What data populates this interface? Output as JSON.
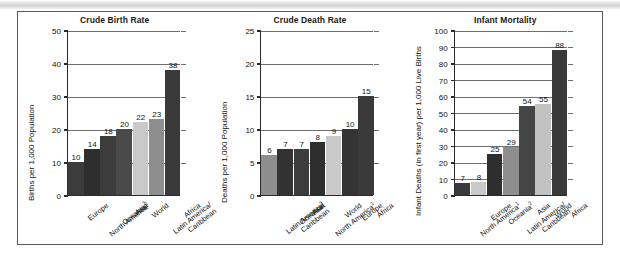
{
  "figure": {
    "panel_count": 3
  },
  "chart_data": [
    {
      "type": "bar",
      "title": "Crude Birth Rate",
      "ylabel": "Births per 1,000 Population",
      "xlabel": "",
      "ylim": [
        0,
        50
      ],
      "yticks": [
        0,
        10,
        20,
        30,
        40,
        50
      ],
      "grid": true,
      "categories": [
        "Europe",
        "North America¹",
        "Oceania²",
        "Asia",
        "World",
        "Latin America/ Caribbean",
        "Africa"
      ],
      "category_lines": [
        [
          "Europe"
        ],
        [
          "North America¹"
        ],
        [
          "Oceania²"
        ],
        [
          "Asia"
        ],
        [
          "World"
        ],
        [
          "Latin America/",
          "Caribbean"
        ],
        [
          "Africa"
        ]
      ],
      "values": [
        10,
        14,
        18,
        20,
        22,
        23,
        38
      ],
      "value_labels": [
        "10",
        "14",
        "18",
        "20",
        "22",
        "23",
        "38"
      ],
      "bar_colors": [
        "#3c3c3c",
        "#2e2e2e",
        "#3c3c3c",
        "#4a4a4a",
        "#c9c9c9",
        "#8e8e8e",
        "#3a3a3a"
      ]
    },
    {
      "type": "bar",
      "title": "Crude Death Rate",
      "ylabel": "Deaths per 1,000 Population",
      "xlabel": "",
      "ylim": [
        0,
        25
      ],
      "yticks": [
        0,
        5,
        10,
        15,
        20,
        25
      ],
      "grid": true,
      "categories": [
        "Latin America/ Caribbean",
        "Oceania²",
        "Asia",
        "North America¹",
        "World",
        "Europe",
        "Africa"
      ],
      "category_lines": [
        [
          "Latin America/",
          "Caribbean"
        ],
        [
          "Oceania²"
        ],
        [
          "Asia"
        ],
        [
          "North America¹"
        ],
        [
          "World"
        ],
        [
          "Europe"
        ],
        [
          "Africa"
        ]
      ],
      "values": [
        6,
        7,
        7,
        8,
        9,
        10,
        15
      ],
      "value_labels": [
        "6",
        "7",
        "7",
        "8",
        "9",
        "10",
        "15"
      ],
      "bar_colors": [
        "#8e8e8e",
        "#323232",
        "#3c3c3c",
        "#2e2e2e",
        "#c9c9c9",
        "#343434",
        "#3a3a3a"
      ]
    },
    {
      "type": "bar",
      "title": "Infant Mortality",
      "ylabel": "Infant Deaths (in first year) per 1,000 Live Births",
      "xlabel": "",
      "ylim": [
        0,
        100
      ],
      "yticks": [
        0,
        10,
        20,
        30,
        40,
        50,
        60,
        70,
        80,
        90,
        100
      ],
      "grid": true,
      "categories": [
        "North America¹",
        "Europe",
        "Oceania²",
        "Latin America/ Caribbean",
        "Asia",
        "World",
        "Africa"
      ],
      "category_lines": [
        [
          "North America¹"
        ],
        [
          "Europe"
        ],
        [
          "Oceania²"
        ],
        [
          "Latin America/",
          "Caribbean"
        ],
        [
          "Asia"
        ],
        [
          "World"
        ],
        [
          "Africa"
        ]
      ],
      "values": [
        7,
        8,
        25,
        29,
        54,
        55,
        88
      ],
      "value_labels": [
        "7",
        "8",
        "25",
        "29",
        "54",
        "55",
        "88"
      ],
      "bar_colors": [
        "#3a3a3a",
        "#c9c9c9",
        "#2e2e2e",
        "#8e8e8e",
        "#454545",
        "#c2c2c2",
        "#3a3a3a"
      ]
    }
  ]
}
